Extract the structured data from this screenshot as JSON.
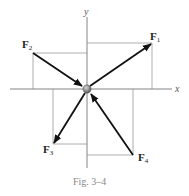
{
  "figure": {
    "caption": "Fig. 3–4",
    "axes": {
      "x_label": "x",
      "y_label": "y"
    },
    "colors": {
      "axis": "#777777",
      "guide": "#9a9a9a",
      "arrow": "#111111",
      "particle": "#8a8a8a"
    },
    "origin": {
      "x": 87,
      "y": 89
    },
    "forces": [
      {
        "name": "F",
        "sub": "1",
        "quadrant": "I",
        "direction": "outward",
        "tip": {
          "x": 152,
          "y": 43
        }
      },
      {
        "name": "F",
        "sub": "2",
        "quadrant": "II",
        "direction": "inward",
        "tail": {
          "x": 33,
          "y": 53
        }
      },
      {
        "name": "F",
        "sub": "3",
        "quadrant": "III",
        "direction": "outward",
        "tip": {
          "x": 53,
          "y": 144
        }
      },
      {
        "name": "F",
        "sub": "4",
        "quadrant": "IV",
        "direction": "inward",
        "tail": {
          "x": 133,
          "y": 155
        }
      }
    ]
  }
}
